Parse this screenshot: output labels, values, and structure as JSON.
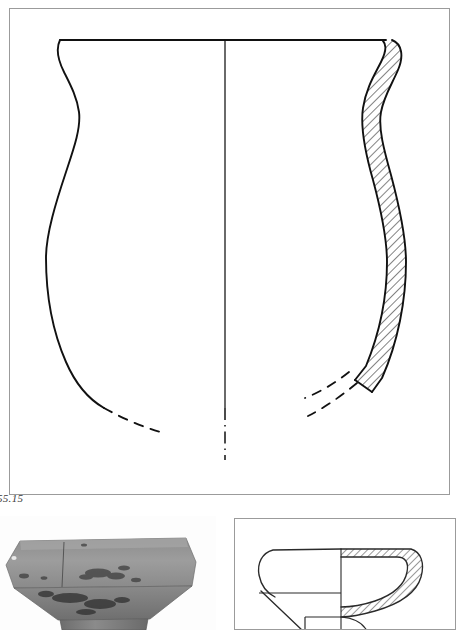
{
  "figure": {
    "label": "55.15",
    "kind": "archaeological-vessel-profile-plate"
  },
  "main_drawing": {
    "name": "vessel-profile-main",
    "vessel_type": "jar",
    "rim_form": "everted",
    "left_half": "exterior-profile-outline",
    "right_half": "hatched-wall-section",
    "axis": "vertical-centre-line",
    "axis_style_upper": "solid",
    "axis_style_lower": "dash-dot",
    "reconstruction_style": "dashed",
    "colors": {
      "ink": "#111111",
      "frame": "#9b9b9b",
      "paper": "#ffffff"
    },
    "geometry": {
      "frame": {
        "x": 9,
        "y": 8,
        "width": 441,
        "height": 487
      },
      "centre_x": 225,
      "rim_y": 40,
      "rim_left_x": 60,
      "rim_right_x": 392,
      "neck_waist_y": 112,
      "neck_waist_left_x": 79,
      "max_body_y": 250,
      "max_body_left_x": 46,
      "solid_profile_end_y": 400,
      "dashed_end_y": 432,
      "hatch_angle_deg": 45,
      "hatch_spacing_px": 6,
      "wall_thickness_px": 19
    }
  },
  "photograph": {
    "name": "artefact-photograph",
    "subject": "pedestal-footed stone vessel, upper bowl and stem",
    "tone": "greyscale",
    "geometry": {
      "x": 0,
      "y": 516,
      "width": 216,
      "height": 114
    }
  },
  "detail_drawing": {
    "name": "vessel-profile-detail",
    "vessel_type": "carinated bowl on pedestal foot",
    "left_half": "exterior-profile-outline",
    "right_half": "hatched-wall-section",
    "axis": "vertical-centre-line",
    "geometry": {
      "x": 234,
      "y": 518,
      "width": 222,
      "height": 112
    },
    "colors": {
      "ink": "#111111",
      "frame": "#9b9b9b"
    }
  }
}
